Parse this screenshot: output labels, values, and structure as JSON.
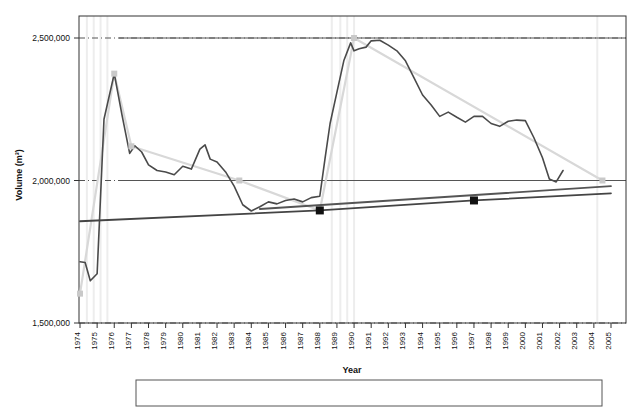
{
  "chart_data": {
    "type": "line",
    "title": "",
    "xlabel": "Year",
    "ylabel": "Volume (m³)",
    "xlim": [
      1974,
      2005
    ],
    "ylim": [
      1500000,
      2560000
    ],
    "yticks": [
      1500000,
      2000000,
      2500000
    ],
    "ytick_labels": [
      "1,500,000",
      "2,000,000",
      "2,500,000"
    ],
    "xticks": [
      1974,
      1975,
      1976,
      1977,
      1978,
      1979,
      1980,
      1981,
      1982,
      1983,
      1984,
      1985,
      1986,
      1987,
      1988,
      1989,
      1990,
      1991,
      1992,
      1993,
      1994,
      1995,
      1996,
      1997,
      1998,
      1999,
      2000,
      2001,
      2002,
      2003,
      2004,
      2005
    ],
    "xtick_labels": [
      "1974",
      "1975",
      "1976",
      "1977",
      "1978",
      "1979",
      "1980",
      "1981",
      "1982",
      "1983",
      "1984",
      "1985",
      "1986",
      "1987",
      "1988",
      "1989",
      "1990",
      "1991",
      "1992",
      "1993",
      "1994",
      "1995",
      "1996",
      "1997",
      "1998",
      "1999",
      "2000",
      "2001",
      "2002",
      "2003",
      "2004",
      "2005"
    ],
    "grid": true,
    "grid_style": "dash-dot horizontal gridlines at y ticks",
    "legend_position": "bottom-outside",
    "series": [
      {
        "name": "Simple changes",
        "type": "line-with-markers",
        "color": "#d8d8d8",
        "marker": "square",
        "marker_color": "#c9c9c9",
        "x": [
          1974.0,
          1976.0,
          1977.0,
          1983.3,
          1988.0,
          1990.0,
          2004.5
        ],
        "values": [
          1603000,
          2375000,
          2120000,
          2000000,
          1895000,
          2500000,
          2000000
        ]
      },
      {
        "name": "Rolling Average",
        "type": "line",
        "color": "#4a4a4a",
        "x": [
          1974.0,
          1974.3,
          1974.6,
          1975.0,
          1975.4,
          1976.0,
          1976.45,
          1976.9,
          1977.2,
          1977.6,
          1978.0,
          1978.5,
          1979.0,
          1979.5,
          1980.0,
          1980.5,
          1981.0,
          1981.3,
          1981.6,
          1982.0,
          1982.5,
          1983.0,
          1983.5,
          1984.0,
          1984.5,
          1985.0,
          1985.5,
          1986.0,
          1986.5,
          1987.0,
          1987.5,
          1988.0,
          1988.3,
          1988.6,
          1989.0,
          1989.4,
          1989.8,
          1990.0,
          1990.3,
          1990.7,
          1991.0,
          1991.5,
          1992.0,
          1992.5,
          1993.0,
          1993.5,
          1994.0,
          1994.5,
          1995.0,
          1995.5,
          1996.0,
          1996.5,
          1997.0,
          1997.5,
          1998.0,
          1998.5,
          1999.0,
          1999.5,
          2000.0,
          2000.5,
          2001.0,
          2001.4,
          2001.8,
          2002.2
        ],
        "values": [
          1715000,
          1712000,
          1648000,
          1673000,
          2215000,
          2375000,
          2230000,
          2095000,
          2122000,
          2100000,
          2055000,
          2035000,
          2030000,
          2020000,
          2050000,
          2040000,
          2110000,
          2125000,
          2075000,
          2065000,
          2030000,
          1980000,
          1915000,
          1893000,
          1908000,
          1925000,
          1918000,
          1930000,
          1935000,
          1925000,
          1940000,
          1945000,
          2075000,
          2200000,
          2310000,
          2420000,
          2483000,
          2455000,
          2462000,
          2468000,
          2490000,
          2492000,
          2475000,
          2455000,
          2420000,
          2360000,
          2300000,
          2265000,
          2225000,
          2240000,
          2222000,
          2205000,
          2225000,
          2225000,
          2200000,
          2190000,
          2208000,
          2212000,
          2210000,
          2150000,
          2080000,
          2005000,
          1995000,
          2035000
        ]
      },
      {
        "name": "Critical beach volume",
        "type": "line-with-markers",
        "color": "#444444",
        "marker": "square",
        "marker_color": "#111111",
        "x": [
          1974.0,
          1988.0,
          1997.0,
          2005.0
        ],
        "values": [
          1857000,
          1895000,
          1930000,
          1955000
        ],
        "marker_x": [
          1988.0,
          1997.0
        ],
        "marker_values": [
          1895000,
          1930000
        ]
      },
      {
        "name": "Trend line",
        "type": "line",
        "color": "#555555",
        "x": [
          1984.5,
          2005.0
        ],
        "values": [
          1900000,
          1980000
        ]
      }
    ],
    "replenishment_lines": {
      "name": "Dates of replenishment",
      "color": "#ededed",
      "years": [
        1974.4,
        1974.8,
        1975.2,
        1975.6,
        1988.7,
        1989.2,
        1989.6,
        1990.0,
        2004.2
      ]
    }
  },
  "legend": {
    "items": [
      {
        "label": "Simple changes",
        "style": "light-line-with-square-marker"
      },
      {
        "label": "Rolling Average",
        "style": "dark-solid-line"
      },
      {
        "label": "Dates of replenishment",
        "style": "text-only"
      },
      {
        "label": "Critical beach volume",
        "style": "dark-line-with-black-square-marker"
      }
    ]
  },
  "colors": {
    "rolling_average": "#4a4a4a",
    "simple_changes": "#d8d8d8",
    "critical_volume": "#222222",
    "replenishment": "#ededed",
    "axis": "#333333",
    "background": "#ffffff"
  }
}
